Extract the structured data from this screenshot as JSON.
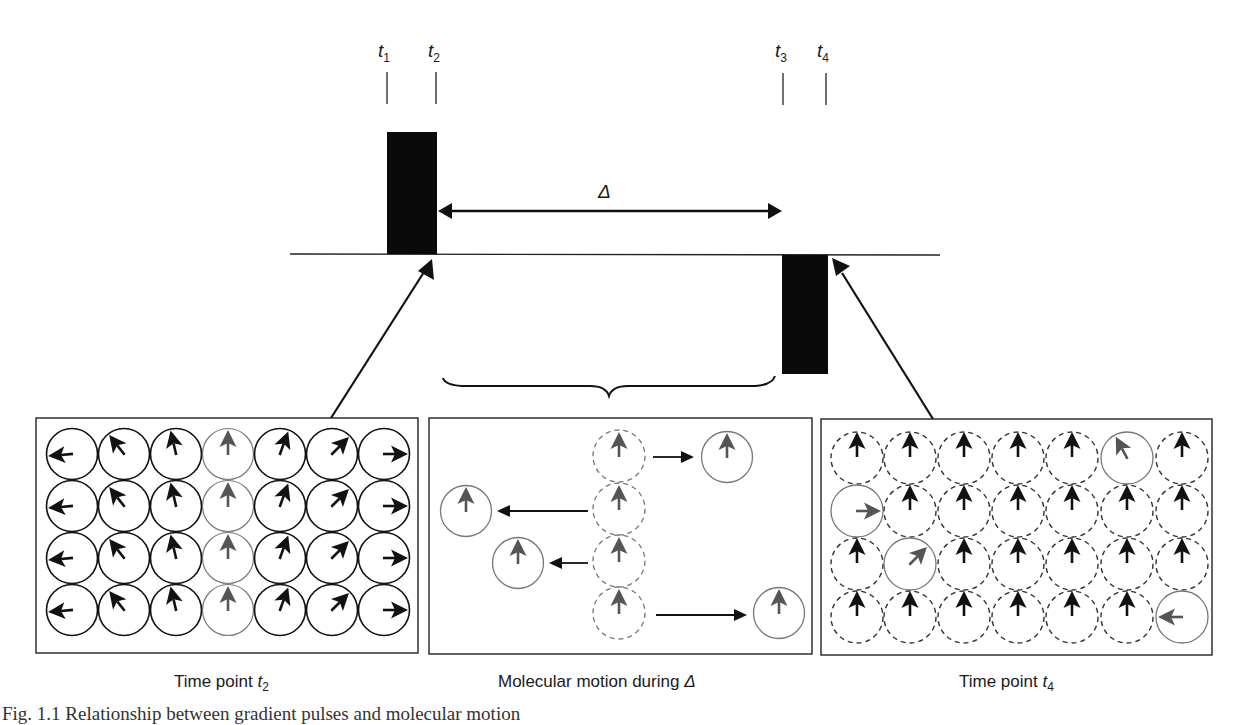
{
  "figure": {
    "time_labels": [
      {
        "base": "t",
        "sub": "1",
        "x": 387
      },
      {
        "base": "t",
        "sub": "2",
        "x": 436
      },
      {
        "base": "t",
        "sub": "3",
        "x": 784
      },
      {
        "base": "t",
        "sub": "4",
        "x": 826
      }
    ],
    "delta_symbol": "Δ",
    "pulses": [
      {
        "name": "first-gradient-pulse",
        "x": 387,
        "y": 132,
        "w": 50,
        "h": 122,
        "direction": "positive"
      },
      {
        "name": "second-gradient-pulse",
        "x": 782,
        "y": 255,
        "w": 46,
        "h": 119,
        "direction": "negative"
      }
    ],
    "panels": [
      {
        "id": "t2",
        "label_text": "Time point ",
        "label_italic": "t",
        "label_sub": "2",
        "description": "All spins phase-encoded with position-dependent orientation"
      },
      {
        "id": "motion",
        "label_text": "Molecular motion during ",
        "label_italic": "Δ",
        "description": "Four highlighted molecules move from original (dashed) to new (solid) positions"
      },
      {
        "id": "t4",
        "label_text": "Time point ",
        "label_italic": "t",
        "label_sub": "4",
        "description": "Stationary spins refocused (up); moved spins retain residual phase"
      }
    ],
    "caption_fragment": "Fig. 1.1  Relationship between gradient pulses and molecular motion"
  },
  "colors": {
    "ink": "#111111",
    "moved_gray": "#555555",
    "moved_circle": "#777777",
    "dashed": "#333333"
  }
}
